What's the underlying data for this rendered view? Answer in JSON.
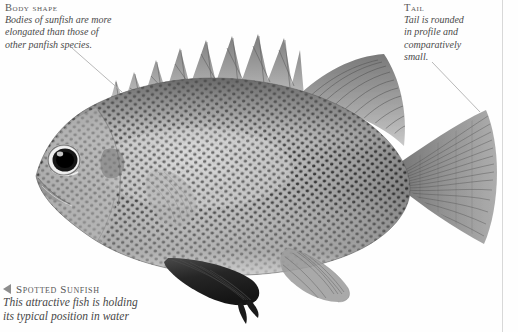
{
  "page": {
    "background_color": "#fefefe",
    "text_color": "#4b4b4b",
    "rule_color": "#d8d8d8"
  },
  "callouts": [
    {
      "id": "body-shape",
      "heading": "Body shape",
      "lines": [
        "Bodies of sunfish are more",
        "elongated than those of",
        "other panfish species."
      ]
    },
    {
      "id": "tail",
      "heading": "Tail",
      "lines": [
        "Tail is rounded",
        "in profile and",
        "comparatively",
        "small."
      ]
    }
  ],
  "caption": {
    "marker": "triangle-left-icon",
    "heading": "Spotted Sunfish",
    "lines": [
      "This attractive fish is holding",
      "its typical position in water"
    ]
  },
  "figure": {
    "alt": "Grayscale photograph of a spotted sunfish in left profile",
    "colors": {
      "body_light": "#c9c9c9",
      "body_mid": "#9a9a9a",
      "body_dark": "#5d5d5d",
      "spot": "#1d1d1d",
      "fin_gray": "#8f8f8f",
      "pelvic_dark": "#2b2b2b",
      "eye": "#111111"
    }
  }
}
